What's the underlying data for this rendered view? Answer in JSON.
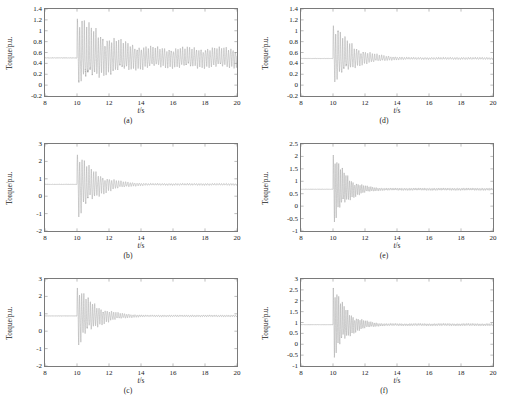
{
  "figure": {
    "columns": 2,
    "rows": 3,
    "background": "#ffffff",
    "trace_color": "#9a9a9a",
    "axis_color": "#7a7a7a",
    "text_color": "#1a1a1a"
  },
  "chart_data": [
    {
      "id": "a",
      "type": "line",
      "caption": "(a)",
      "title": "",
      "xlabel": "t/s",
      "ylabel": "Torque/p.u.",
      "xlim": [
        8,
        20
      ],
      "ylim": [
        -0.2,
        1.4
      ],
      "xticks": [
        8,
        10,
        12,
        14,
        16,
        18,
        20
      ],
      "xticklabels": [
        "8",
        "10",
        "12",
        "14",
        "16",
        "18",
        "20"
      ],
      "yticks": [
        -0.2,
        0,
        0.2,
        0.4,
        0.6,
        0.8,
        1.0,
        1.2,
        1.4
      ],
      "yticklabels": [
        "-0.2",
        "0",
        "0.2",
        "0.4",
        "0.6",
        "0.8",
        "1",
        "1.2",
        "1.4"
      ],
      "grid": false,
      "legend": null,
      "series": [
        {
          "name": "electromagnetic torque",
          "steady_value": 0.5,
          "disturbance_time": 10.0,
          "oscillation_frequency_hz": 7.0,
          "envelope_profile": "sustained",
          "peak_high": 1.34,
          "peak_low": -0.02,
          "settle_high": 0.62,
          "settle_low": 0.35,
          "decay_end_time": 15.0,
          "damped": false
        }
      ]
    },
    {
      "id": "b",
      "type": "line",
      "caption": "(b)",
      "title": "",
      "xlabel": "t/s",
      "ylabel": "Torque/p.u.",
      "xlim": [
        8,
        20
      ],
      "ylim": [
        -2,
        3
      ],
      "xticks": [
        8,
        10,
        12,
        14,
        16,
        18,
        20
      ],
      "xticklabels": [
        "8",
        "10",
        "12",
        "14",
        "16",
        "18",
        "20"
      ],
      "yticks": [
        -2,
        -1,
        0,
        1,
        2,
        3
      ],
      "yticklabels": [
        "-2",
        "-1",
        "0",
        "1",
        "2",
        "3"
      ],
      "grid": false,
      "legend": null,
      "series": [
        {
          "name": "electromagnetic torque",
          "steady_value": 0.68,
          "disturbance_time": 10.0,
          "oscillation_frequency_hz": 7.0,
          "envelope_profile": "decaying",
          "peak_high": 2.72,
          "peak_low": -1.62,
          "settle_high": 0.7,
          "settle_low": 0.66,
          "decay_end_time": 14.5,
          "damped": true
        }
      ]
    },
    {
      "id": "c",
      "type": "line",
      "caption": "(c)",
      "title": "",
      "xlabel": "t/s",
      "ylabel": "Torque/p.u.",
      "xlim": [
        8,
        20
      ],
      "ylim": [
        -2,
        3
      ],
      "xticks": [
        8,
        10,
        12,
        14,
        16,
        18,
        20
      ],
      "xticklabels": [
        "8",
        "10",
        "12",
        "14",
        "16",
        "18",
        "20"
      ],
      "yticks": [
        -2,
        -1,
        0,
        1,
        2,
        3
      ],
      "yticklabels": [
        "-2",
        "-1",
        "0",
        "1",
        "2",
        "3"
      ],
      "grid": false,
      "legend": null,
      "series": [
        {
          "name": "electromagnetic torque",
          "steady_value": 0.88,
          "disturbance_time": 10.0,
          "oscillation_frequency_hz": 7.5,
          "envelope_profile": "decaying",
          "peak_high": 2.78,
          "peak_low": -1.18,
          "settle_high": 0.9,
          "settle_low": 0.86,
          "decay_end_time": 14.3,
          "damped": true
        }
      ]
    },
    {
      "id": "d",
      "type": "line",
      "caption": "(d)",
      "title": "",
      "xlabel": "t/s",
      "ylabel": "Torque/p.u.",
      "xlim": [
        8,
        20
      ],
      "ylim": [
        -0.2,
        1.4
      ],
      "xticks": [
        8,
        10,
        12,
        14,
        16,
        18,
        20
      ],
      "xticklabels": [
        "8",
        "10",
        "12",
        "14",
        "16",
        "18",
        "20"
      ],
      "yticks": [
        -0.2,
        0,
        0.2,
        0.4,
        0.6,
        0.8,
        1.0,
        1.2,
        1.4
      ],
      "yticklabels": [
        "-0.2",
        "0",
        "0.2",
        "0.4",
        "0.6",
        "0.8",
        "1",
        "1.2",
        "1.4"
      ],
      "grid": false,
      "legend": null,
      "series": [
        {
          "name": "electromagnetic torque",
          "steady_value": 0.49,
          "disturbance_time": 10.0,
          "oscillation_frequency_hz": 7.0,
          "envelope_profile": "decaying",
          "peak_high": 1.21,
          "peak_low": -0.02,
          "settle_high": 0.5,
          "settle_low": 0.48,
          "decay_end_time": 14.8,
          "damped": true
        }
      ]
    },
    {
      "id": "e",
      "type": "line",
      "caption": "(e)",
      "title": "",
      "xlabel": "t/s",
      "ylabel": "Torque/p.u.",
      "xlim": [
        8,
        20
      ],
      "ylim": [
        -1,
        2.5
      ],
      "xticks": [
        8,
        10,
        12,
        14,
        16,
        18,
        20
      ],
      "xticklabels": [
        "8",
        "10",
        "12",
        "14",
        "16",
        "18",
        "20"
      ],
      "yticks": [
        -1,
        -0.5,
        0,
        0.5,
        1,
        1.5,
        2,
        2.5
      ],
      "yticklabels": [
        "-1",
        "-0.5",
        "0",
        "0.5",
        "1",
        "1.5",
        "2",
        "2.5"
      ],
      "grid": false,
      "legend": null,
      "series": [
        {
          "name": "electromagnetic torque",
          "steady_value": 0.68,
          "disturbance_time": 10.0,
          "oscillation_frequency_hz": 9.0,
          "envelope_profile": "fast-decaying",
          "peak_high": 2.33,
          "peak_low": -0.92,
          "settle_high": 0.7,
          "settle_low": 0.66,
          "decay_end_time": 13.2,
          "damped": true
        }
      ]
    },
    {
      "id": "f",
      "type": "line",
      "caption": "(f)",
      "title": "",
      "xlabel": "t/s",
      "ylabel": "Torque/p.u.",
      "xlim": [
        8,
        20
      ],
      "ylim": [
        -1,
        3
      ],
      "xticks": [
        8,
        10,
        12,
        14,
        16,
        18,
        20
      ],
      "xticklabels": [
        "8",
        "10",
        "12",
        "14",
        "16",
        "18",
        "20"
      ],
      "yticks": [
        -1,
        -0.5,
        0,
        0.5,
        1,
        1.5,
        2,
        2.5,
        3
      ],
      "yticklabels": [
        "-1",
        "-0.5",
        "0",
        "0.5",
        "1",
        "1.5",
        "2",
        "2.5",
        "3"
      ],
      "grid": false,
      "legend": null,
      "series": [
        {
          "name": "electromagnetic torque",
          "steady_value": 0.9,
          "disturbance_time": 10.0,
          "oscillation_frequency_hz": 9.0,
          "envelope_profile": "fast-decaying",
          "peak_high": 2.93,
          "peak_low": -0.95,
          "settle_high": 0.92,
          "settle_low": 0.88,
          "decay_end_time": 13.3,
          "damped": true
        }
      ]
    }
  ]
}
